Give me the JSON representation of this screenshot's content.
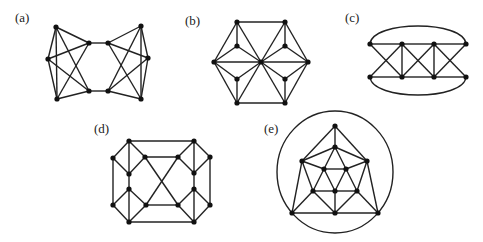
{
  "figure": {
    "width": 483,
    "height": 242,
    "edge_color": "#222222",
    "vertex_color": "#111111",
    "vertex_radius": 2.6
  },
  "graphs": [
    {
      "id": "a",
      "label": "(a)",
      "label_pos": [
        15,
        22
      ],
      "vertices": {
        "L_top": [
          56,
          27
        ],
        "L_mid": [
          48,
          59
        ],
        "L_bot": [
          57,
          99
        ],
        "C_lt": [
          89,
          43
        ],
        "C_lb": [
          89,
          91
        ],
        "C_rt": [
          108,
          43
        ],
        "C_rb": [
          108,
          91
        ],
        "R_top": [
          141,
          26
        ],
        "R_mid": [
          148,
          58
        ],
        "R_bot": [
          141,
          99
        ]
      },
      "edges": [
        [
          "L_top",
          "L_mid"
        ],
        [
          "L_top",
          "L_bot"
        ],
        [
          "L_mid",
          "L_bot"
        ],
        [
          "L_top",
          "C_lt"
        ],
        [
          "L_top",
          "C_lb"
        ],
        [
          "L_mid",
          "C_lt"
        ],
        [
          "L_mid",
          "C_lb"
        ],
        [
          "L_bot",
          "C_lt"
        ],
        [
          "L_bot",
          "C_lb"
        ],
        [
          "C_lt",
          "C_rt"
        ],
        [
          "C_lb",
          "C_rb"
        ],
        [
          "R_top",
          "R_mid"
        ],
        [
          "R_top",
          "R_bot"
        ],
        [
          "R_mid",
          "R_bot"
        ],
        [
          "R_top",
          "C_rt"
        ],
        [
          "R_top",
          "C_rb"
        ],
        [
          "R_mid",
          "C_rt"
        ],
        [
          "R_mid",
          "C_rb"
        ],
        [
          "R_bot",
          "C_rt"
        ],
        [
          "R_bot",
          "C_rb"
        ]
      ],
      "arcs": []
    },
    {
      "id": "b",
      "label": "(b)",
      "label_pos": [
        185,
        25
      ],
      "vertices": {
        "TL": [
          237,
          22
        ],
        "TR": [
          285,
          22
        ],
        "L": [
          214,
          62
        ],
        "C": [
          261,
          62
        ],
        "R": [
          308,
          62
        ],
        "BL": [
          237,
          103
        ],
        "BR": [
          285,
          103
        ],
        "iTL": [
          237,
          46
        ],
        "iTR": [
          285,
          46
        ],
        "iBL": [
          237,
          79
        ],
        "iBR": [
          285,
          79
        ]
      },
      "edges": [
        [
          "TL",
          "TR"
        ],
        [
          "TR",
          "R"
        ],
        [
          "R",
          "BR"
        ],
        [
          "BR",
          "BL"
        ],
        [
          "BL",
          "L"
        ],
        [
          "L",
          "TL"
        ],
        [
          "L",
          "C"
        ],
        [
          "C",
          "R"
        ],
        [
          "TL",
          "C"
        ],
        [
          "TR",
          "C"
        ],
        [
          "BL",
          "C"
        ],
        [
          "BR",
          "C"
        ],
        [
          "iTL",
          "TL"
        ],
        [
          "iTL",
          "L"
        ],
        [
          "iTL",
          "C"
        ],
        [
          "iBL",
          "BL"
        ],
        [
          "iBL",
          "L"
        ],
        [
          "iBL",
          "C"
        ],
        [
          "iTR",
          "TR"
        ],
        [
          "iTR",
          "R"
        ],
        [
          "iTR",
          "C"
        ],
        [
          "iBR",
          "BR"
        ],
        [
          "iBR",
          "R"
        ],
        [
          "iBR",
          "C"
        ]
      ],
      "arcs": []
    },
    {
      "id": "c",
      "label": "(c)",
      "label_pos": [
        345,
        22
      ],
      "vertices": {
        "t1": [
          370,
          44
        ],
        "t2": [
          402,
          44
        ],
        "t3": [
          434,
          44
        ],
        "t4": [
          466,
          44
        ],
        "b1": [
          370,
          77
        ],
        "b2": [
          402,
          77
        ],
        "b3": [
          434,
          77
        ],
        "b4": [
          466,
          77
        ]
      },
      "edges": [
        [
          "t1",
          "t2"
        ],
        [
          "t2",
          "t3"
        ],
        [
          "t3",
          "t4"
        ],
        [
          "b1",
          "b2"
        ],
        [
          "b2",
          "b3"
        ],
        [
          "b3",
          "b4"
        ],
        [
          "t2",
          "b2"
        ],
        [
          "t3",
          "b3"
        ],
        [
          "t1",
          "b2"
        ],
        [
          "b1",
          "t2"
        ],
        [
          "t2",
          "b3"
        ],
        [
          "b2",
          "t3"
        ],
        [
          "t3",
          "b4"
        ],
        [
          "b3",
          "t4"
        ]
      ],
      "arcs": [
        {
          "from": "t1",
          "to": "t4",
          "path": "M370 44 C 372 20, 464 20, 466 44"
        },
        {
          "from": "b1",
          "to": "b4",
          "path": "M370 77 C 372 101, 464 101, 466 77"
        }
      ]
    },
    {
      "id": "d",
      "label": "(d)",
      "label_pos": [
        94,
        133
      ],
      "vertices": {
        "A": [
          129,
          141
        ],
        "B": [
          113,
          158
        ],
        "C": [
          145,
          157
        ],
        "D": [
          129,
          174
        ],
        "E": [
          129,
          189
        ],
        "F": [
          113,
          205
        ],
        "G": [
          146,
          205
        ],
        "H": [
          129,
          222
        ],
        "I": [
          194,
          141
        ],
        "J": [
          178,
          157
        ],
        "K": [
          210,
          157
        ],
        "L": [
          194,
          173
        ],
        "M": [
          194,
          189
        ],
        "N": [
          178,
          205
        ],
        "O": [
          210,
          205
        ],
        "P": [
          194,
          222
        ]
      },
      "edges": [
        [
          "A",
          "I"
        ],
        [
          "H",
          "P"
        ],
        [
          "A",
          "B"
        ],
        [
          "A",
          "C"
        ],
        [
          "A",
          "D"
        ],
        [
          "B",
          "D"
        ],
        [
          "C",
          "D"
        ],
        [
          "D",
          "E"
        ],
        [
          "B",
          "F"
        ],
        [
          "E",
          "F"
        ],
        [
          "E",
          "G"
        ],
        [
          "E",
          "H"
        ],
        [
          "F",
          "H"
        ],
        [
          "G",
          "H"
        ],
        [
          "I",
          "K"
        ],
        [
          "I",
          "J"
        ],
        [
          "I",
          "L"
        ],
        [
          "K",
          "L"
        ],
        [
          "J",
          "L"
        ],
        [
          "L",
          "M"
        ],
        [
          "K",
          "O"
        ],
        [
          "M",
          "O"
        ],
        [
          "M",
          "N"
        ],
        [
          "M",
          "P"
        ],
        [
          "O",
          "P"
        ],
        [
          "N",
          "P"
        ],
        [
          "C",
          "J"
        ],
        [
          "G",
          "N"
        ],
        [
          "C",
          "N"
        ],
        [
          "G",
          "J"
        ]
      ],
      "arcs": []
    },
    {
      "id": "e",
      "label": "(e)",
      "label_pos": [
        264,
        133
      ],
      "vertices": {
        "T": [
          335,
          126
        ],
        "U": [
          335,
          147
        ],
        "LU": [
          302,
          161
        ],
        "RU": [
          367,
          161
        ],
        "IL": [
          324,
          169
        ],
        "IR": [
          346,
          169
        ],
        "ML": [
          313,
          191
        ],
        "MC": [
          335,
          191
        ],
        "MR": [
          357,
          191
        ],
        "BL": [
          292,
          213
        ],
        "BC": [
          335,
          213
        ],
        "BR": [
          378,
          213
        ]
      },
      "edges": [
        [
          "T",
          "U"
        ],
        [
          "T",
          "LU"
        ],
        [
          "T",
          "RU"
        ],
        [
          "U",
          "LU"
        ],
        [
          "U",
          "RU"
        ],
        [
          "U",
          "IL"
        ],
        [
          "U",
          "IR"
        ],
        [
          "LU",
          "IL"
        ],
        [
          "RU",
          "IR"
        ],
        [
          "IL",
          "IR"
        ],
        [
          "IL",
          "ML"
        ],
        [
          "IL",
          "MC"
        ],
        [
          "IR",
          "MC"
        ],
        [
          "IR",
          "MR"
        ],
        [
          "LU",
          "ML"
        ],
        [
          "RU",
          "MR"
        ],
        [
          "ML",
          "MC"
        ],
        [
          "MC",
          "MR"
        ],
        [
          "LU",
          "BL"
        ],
        [
          "RU",
          "BR"
        ],
        [
          "ML",
          "BL"
        ],
        [
          "ML",
          "BC"
        ],
        [
          "MC",
          "BC"
        ],
        [
          "MR",
          "BC"
        ],
        [
          "MR",
          "BR"
        ],
        [
          "BL",
          "BC"
        ],
        [
          "BC",
          "BR"
        ]
      ],
      "arcs": [],
      "ellipse": {
        "cx": 335,
        "cy": 172,
        "rx": 58,
        "ry": 61
      }
    }
  ]
}
